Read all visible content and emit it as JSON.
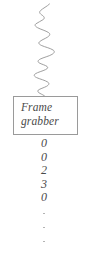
{
  "figure": {
    "background_color": "#ffffff",
    "line_color": "#8e8e8e",
    "text_color": "#4a4a4a",
    "border_color": "#9a9a9a"
  },
  "signal": {
    "name": "analog-input-waveform",
    "description": "jagged vertical analog signal trace entering the frame grabber",
    "orientation": "vertical",
    "stroke_color": "#8e8e8e",
    "path": "M 49.5 4 C 47 6.5 43 8.2 40.5 10.6 C 38.6 12.4 40.2 13.9 42 15.1 C 44.2 16.6 45.1 18.1 43.2 19.6 C 40.8 21.4 37.8 22.2 35.8 23.9 C 34.2 25.3 35.6 26.6 37.4 27.6 C 40.6 29.4 45.6 30.6 48.6 32.6 C 50.8 34.1 49.6 35.8 47.4 37.2 C 44.6 38.9 41.2 40.1 39.4 41.9 C 37.9 43.4 39.6 44.6 41.8 45.6 C 45.2 47.1 50.4 48.2 53.2 50.1 C 55.2 51.5 54.2 53.1 52 54.4 C 48.8 56.3 43.6 57.4 40.2 59.1 C 37.8 60.3 37.4 61.8 39.2 62.9 C 41.4 64.2 45.2 65.1 47 66.4 C 48.4 67.4 47.6 68.6 45.6 69.6 C 42.6 71.1 37.6 72.2 35.2 73.9 C 33.4 75.2 34.4 76.6 36.6 77.6 C 39.8 79.1 45 80.2 47.8 82.1 C 49.8 83.5 48.8 85.1 46.4 86.4 C 43.8 87.8 39.8 88.8 38.2 90.2 C 37 91.3 38.2 92.4 40 93.4 C 41.8 94.4 43.8 95.2 44.6 96"
  },
  "device": {
    "name": "frame-grabber",
    "label": "Frame\ngrabber",
    "label_line_1": "Frame",
    "label_line_2": "grabber",
    "border_color": "#9a9a9a"
  },
  "output": {
    "name": "digital-output-values",
    "description": "column of digitized sample values emitted by the frame grabber",
    "values": [
      "0",
      "0",
      "2",
      "3",
      "0"
    ],
    "continuation": "vertical-ellipsis",
    "ellipsis_dots": 3
  }
}
